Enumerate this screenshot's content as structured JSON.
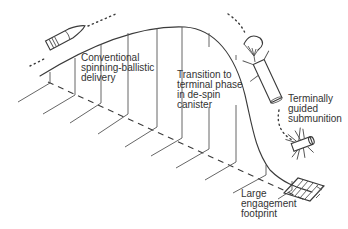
{
  "diagram": {
    "labels": {
      "conventional": [
        "Conventional",
        "spinning-ballistic",
        "delivery"
      ],
      "transition": [
        "Transition to",
        "terminal phase",
        "in de-spin",
        "canister"
      ],
      "guided": [
        "Terminally",
        "guided",
        "submunition"
      ],
      "footprint": [
        "Large",
        "engagement",
        "footprint"
      ]
    },
    "icons": [
      "projectile-shell-icon",
      "parachute-canister-icon",
      "submunition-icon",
      "footprint-target-icon"
    ],
    "colors": {
      "ink": "#3a3a3a",
      "background": "#ffffff"
    }
  }
}
